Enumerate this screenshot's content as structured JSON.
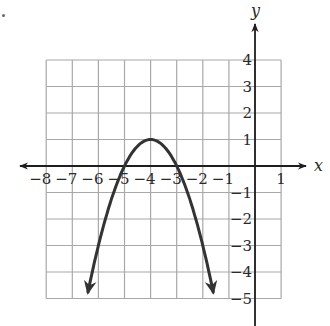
{
  "chart_data": {
    "type": "line",
    "title": "",
    "xlabel": "x",
    "ylabel": "y",
    "xlim": [
      -8,
      1
    ],
    "ylim": [
      -5,
      4
    ],
    "grid": true,
    "x_ticks": [
      -8,
      -7,
      -6,
      -5,
      -4,
      -3,
      -2,
      -1,
      1
    ],
    "x_tick_labels": [
      "−8",
      "−7",
      "−6",
      "−5",
      "−4",
      "−3",
      "−2",
      "−1",
      "1"
    ],
    "y_ticks": [
      4,
      3,
      2,
      1,
      -1,
      -2,
      -3,
      -4,
      -5
    ],
    "y_tick_labels": [
      "4",
      "3",
      "2",
      "1",
      "−1",
      "−2",
      "−3",
      "−4",
      "−5"
    ],
    "series": [
      {
        "name": "parabola",
        "equation": "y = -(x + 4)^2 + 1",
        "vertex": [
          -4,
          1
        ],
        "x_intercepts": [
          -5,
          -3
        ],
        "x": [
          -6.4,
          -6,
          -5.5,
          -5,
          -4.5,
          -4,
          -3.5,
          -3,
          -2.5,
          -2,
          -1.6
        ],
        "y": [
          -4.76,
          -3,
          -1.25,
          0,
          0.75,
          1,
          0.75,
          0,
          -1.25,
          -3,
          -4.76
        ],
        "color": "#333333",
        "arrows_at_ends": true
      }
    ]
  },
  "axes": {
    "x_label": "x",
    "y_label": "y"
  },
  "colors": {
    "grid": "#a8a8a8",
    "axis": "#1e1e1e",
    "curve": "#333333"
  }
}
